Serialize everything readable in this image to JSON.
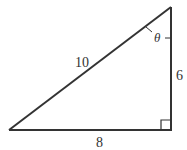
{
  "diagram": {
    "type": "right-triangle",
    "stroke_color": "#333333",
    "background": "#ffffff",
    "labels": {
      "hypotenuse": "10",
      "vertical_leg": "6",
      "horizontal_leg": "8",
      "angle": "θ"
    },
    "right_angle_marker": "bottom-right",
    "angle_location": "top vertex"
  }
}
